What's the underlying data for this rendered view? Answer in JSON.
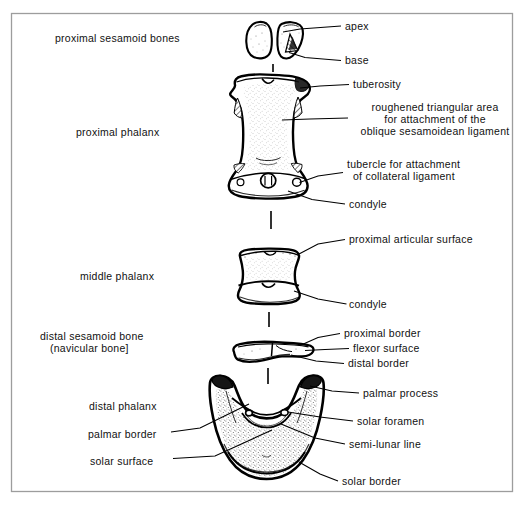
{
  "figure": {
    "border_color": "#9a9a9a",
    "ink_color": "#000000",
    "background": "#ffffff"
  },
  "labels_left": [
    {
      "id": "proximal-sesamoid-bones",
      "text": "proximal sesamoid bones",
      "x": 55,
      "y": 38,
      "align": "left"
    },
    {
      "id": "proximal-phalanx",
      "text": "proximal phalanx",
      "x": 76,
      "y": 132,
      "align": "left"
    },
    {
      "id": "middle-phalanx",
      "text": "middle phalanx",
      "x": 80,
      "y": 276,
      "align": "left"
    },
    {
      "id": "distal-sesamoid-bone-line1",
      "text": "distal sesamoid bone",
      "x": 40,
      "y": 336,
      "align": "left"
    },
    {
      "id": "distal-sesamoid-bone-line2",
      "text": "(navicular bone]",
      "x": 50,
      "y": 348,
      "align": "left"
    },
    {
      "id": "distal-phalanx",
      "text": "distal phalanx",
      "x": 89,
      "y": 406,
      "align": "left"
    },
    {
      "id": "palmar-border",
      "text": "palmar border",
      "x": 88,
      "y": 434,
      "align": "left"
    },
    {
      "id": "solar-surface",
      "text": "solar surface",
      "x": 90,
      "y": 461,
      "align": "left"
    }
  ],
  "labels_right": [
    {
      "id": "apex",
      "text": "apex",
      "x": 345,
      "y": 22,
      "align": "left"
    },
    {
      "id": "base",
      "text": "base",
      "x": 345,
      "y": 57,
      "align": "left"
    },
    {
      "id": "tuberosity",
      "text": "tuberosity",
      "x": 353,
      "y": 81,
      "align": "left"
    },
    {
      "id": "roughened-triangular-area-line1",
      "text": "roughened triangular area",
      "x": 353,
      "y": 106,
      "align": "left"
    },
    {
      "id": "roughened-triangular-area-line2",
      "text": "for attachment of the",
      "x": 353,
      "y": 118,
      "align": "left"
    },
    {
      "id": "roughened-triangular-area-line3",
      "text": "oblique sesamoidean ligament",
      "x": 353,
      "y": 130,
      "align": "left"
    },
    {
      "id": "tubercle-collateral-line1",
      "text": "tubercle for attachment",
      "x": 347,
      "y": 163,
      "align": "left"
    },
    {
      "id": "tubercle-collateral-line2",
      "text": "of collateral ligament",
      "x": 347,
      "y": 175,
      "align": "left"
    },
    {
      "id": "condyle-proximal",
      "text": "condyle",
      "x": 349,
      "y": 201,
      "align": "left"
    },
    {
      "id": "proximal-articular-surface",
      "text": "proximal articular surface",
      "x": 349,
      "y": 236,
      "align": "left"
    },
    {
      "id": "condyle-middle",
      "text": "condyle",
      "x": 349,
      "y": 301,
      "align": "left"
    },
    {
      "id": "proximal-border",
      "text": "proximal border",
      "x": 344,
      "y": 330,
      "align": "left"
    },
    {
      "id": "flexor-surface",
      "text": "flexor surface",
      "x": 353,
      "y": 345,
      "align": "left"
    },
    {
      "id": "distal-border",
      "text": "distal border",
      "x": 348,
      "y": 360,
      "align": "left"
    },
    {
      "id": "palmar-process",
      "text": "palmar process",
      "x": 363,
      "y": 390,
      "align": "left"
    },
    {
      "id": "solar-foramen",
      "text": "solar foramen",
      "x": 357,
      "y": 418,
      "align": "left"
    },
    {
      "id": "semi-lunar-line",
      "text": "semi-lunar line",
      "x": 349,
      "y": 441,
      "align": "left"
    },
    {
      "id": "solar-border",
      "text": "solar border",
      "x": 342,
      "y": 478,
      "align": "left"
    }
  ],
  "bones": [
    {
      "id": "proximal-sesamoid-left",
      "name": "proximal sesamoid bone (left)"
    },
    {
      "id": "proximal-sesamoid-right",
      "name": "proximal sesamoid bone (right)"
    },
    {
      "id": "proximal-phalanx-bone",
      "name": "proximal phalanx"
    },
    {
      "id": "middle-phalanx-bone",
      "name": "middle phalanx"
    },
    {
      "id": "distal-sesamoid-bone",
      "name": "distal sesamoid (navicular) bone"
    },
    {
      "id": "distal-phalanx-bone",
      "name": "distal phalanx"
    }
  ]
}
